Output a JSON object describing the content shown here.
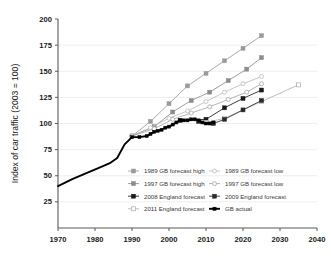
{
  "chart_data": {
    "type": "line",
    "title": "",
    "xlabel": "",
    "ylabel": "Index of car traffic (2003 = 100)",
    "xlim": [
      1970,
      2040
    ],
    "ylim": [
      0,
      200
    ],
    "xticks": [
      1970,
      1980,
      1990,
      2000,
      2010,
      2020,
      2030,
      2040
    ],
    "yticks": [
      25,
      50,
      75,
      100,
      125,
      150,
      175,
      200
    ],
    "grid": "horizontal",
    "legend_position": "inside-bottom-center",
    "series": [
      {
        "name": "1989 GB forecast high",
        "color": "#9a9a9a",
        "marker": "square-filled",
        "x": [
          1990,
          1995,
          2000,
          2005,
          2010,
          2015,
          2020,
          2025
        ],
        "values": [
          88,
          102,
          119,
          136,
          148,
          160,
          172,
          184
        ]
      },
      {
        "name": "1997 GB forecast high",
        "color": "#8c8c8c",
        "marker": "square-filled",
        "x": [
          1990,
          1996,
          2001,
          2006,
          2011,
          2016,
          2021,
          2025
        ],
        "values": [
          88,
          97,
          111,
          122,
          130,
          141,
          152,
          163
        ]
      },
      {
        "name": "2008 England forecast",
        "color": "#1a1a1a",
        "marker": "square-filled",
        "x": [
          2003,
          2010,
          2015,
          2020,
          2025
        ],
        "values": [
          103,
          104,
          115,
          124,
          132
        ]
      },
      {
        "name": "2011 England forecast",
        "color": "#b4b4b4",
        "marker": "square-open",
        "x": [
          2010,
          2015,
          2025,
          2035
        ],
        "values": [
          101,
          105,
          121,
          137
        ]
      },
      {
        "name": "1989 GB forecast low",
        "color": "#bcbcbc",
        "marker": "circle-open",
        "x": [
          1990,
          1995,
          2000,
          2005,
          2010,
          2015,
          2020,
          2025
        ],
        "values": [
          88,
          96,
          105,
          112,
          121,
          130,
          138,
          145
        ]
      },
      {
        "name": "1997 GB forecast low",
        "color": "#a6a6a6",
        "marker": "circle-open",
        "x": [
          1990,
          1996,
          2001,
          2006,
          2011,
          2016,
          2021,
          2025
        ],
        "values": [
          88,
          95,
          104,
          110,
          116,
          123,
          130,
          138
        ]
      },
      {
        "name": "2009 England forecast",
        "color": "#2b2b2b",
        "marker": "square-filled",
        "x": [
          2008,
          2012,
          2015,
          2020,
          2025
        ],
        "values": [
          102,
          100,
          104,
          113,
          122
        ]
      },
      {
        "name": "GB actual",
        "color": "#000000",
        "marker": "square-filled",
        "x": [
          1970,
          1974,
          1978,
          1982,
          1984,
          1986,
          1988,
          1990,
          1992,
          1994,
          1995,
          1996,
          1997,
          1998,
          1999,
          2000,
          2001,
          2002,
          2003,
          2004,
          2005,
          2006,
          2007,
          2008,
          2009,
          2010,
          2011,
          2012
        ],
        "values": [
          40,
          47,
          53,
          59,
          62,
          67,
          80,
          87,
          87,
          88,
          90,
          92,
          93,
          94,
          96,
          97,
          99,
          101,
          103,
          103,
          103,
          104,
          104,
          103,
          101,
          100,
          100,
          101
        ]
      }
    ],
    "legend_entries": [
      {
        "label": "1989 GB forecast high",
        "color": "#9a9a9a",
        "marker": "square-filled",
        "column": "left",
        "row": 0
      },
      {
        "label": "1997 GB forecast high",
        "color": "#8c8c8c",
        "marker": "square-filled",
        "column": "left",
        "row": 1
      },
      {
        "label": "2008 England forecast",
        "color": "#1a1a1a",
        "marker": "square-filled",
        "column": "left",
        "row": 2
      },
      {
        "label": "2011 England forecast",
        "color": "#b4b4b4",
        "marker": "square-open",
        "column": "left",
        "row": 3
      },
      {
        "label": "1989 GB forecast low",
        "color": "#bcbcbc",
        "marker": "circle-open",
        "column": "right",
        "row": 0
      },
      {
        "label": "1997 GB forecast low",
        "color": "#a6a6a6",
        "marker": "circle-open",
        "column": "right",
        "row": 1
      },
      {
        "label": "2009 England forecast",
        "color": "#2b2b2b",
        "marker": "square-filled",
        "column": "right",
        "row": 2
      },
      {
        "label": "GB actual",
        "color": "#000000",
        "marker": "line-thick",
        "column": "right",
        "row": 3
      }
    ]
  },
  "colors": {
    "axis": "#5a5a5a",
    "grid": "#e6e6e6",
    "tick_label": "#1a1a1a",
    "background": "#ffffff"
  },
  "edge_artifacts": {
    "right_margin_text": ""
  }
}
